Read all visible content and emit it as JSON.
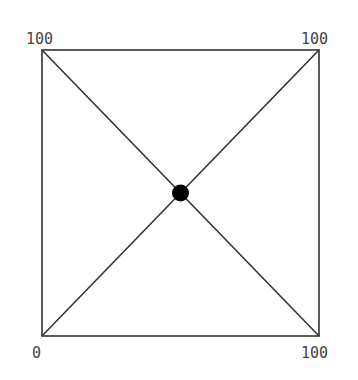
{
  "diagram": {
    "type": "square-with-diagonals",
    "colors": {
      "stroke": "#333333",
      "dot": "#000000",
      "label": "#444444"
    },
    "square": {
      "x1": 42,
      "y1": 50,
      "x2": 319,
      "y2": 336
    },
    "center_point": {
      "label": "intersection",
      "x": 50,
      "y": 50
    },
    "corner_labels": {
      "top_left": "100",
      "top_right": "100",
      "bottom_left": "0",
      "bottom_right": "100"
    }
  }
}
